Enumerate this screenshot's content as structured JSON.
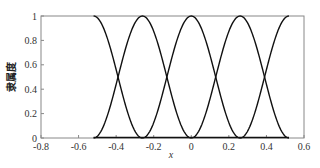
{
  "chart_data": {
    "type": "line",
    "title": "",
    "xlabel": "x",
    "ylabel": "隶属度",
    "xlim": [
      -0.8,
      0.6
    ],
    "ylim": [
      0,
      1
    ],
    "xticks": [
      -0.8,
      -0.6,
      -0.4,
      -0.2,
      0,
      0.2,
      0.4,
      0.6
    ],
    "xtick_labels": [
      "-0.8",
      "-0.6",
      "-0.4",
      "-0.2",
      "0",
      "0.2",
      "0.4",
      "0.6"
    ],
    "yticks": [
      0,
      0.2,
      0.4,
      0.6,
      0.8,
      1
    ],
    "ytick_labels": [
      "0",
      "0.2",
      "0.4",
      "0.6",
      "0.8",
      "1"
    ],
    "grid": false,
    "legend": null,
    "series": [
      {
        "name": "MF1 (left shoulder)",
        "shape": "z-shaped",
        "x_start": -0.52,
        "x_flat_end": -0.52,
        "x_zero": -0.26,
        "peak": 1
      },
      {
        "name": "MF2",
        "shape": "gaussian-like",
        "center": -0.26,
        "support": [
          -0.52,
          0.0
        ],
        "peak": 1
      },
      {
        "name": "MF3",
        "shape": "gaussian-like",
        "center": 0.0,
        "support": [
          -0.26,
          0.26
        ],
        "peak": 1
      },
      {
        "name": "MF4",
        "shape": "gaussian-like",
        "center": 0.26,
        "support": [
          0.0,
          0.52
        ],
        "peak": 1
      },
      {
        "name": "MF5 (right shoulder)",
        "shape": "s-shaped",
        "x_zero": 0.26,
        "x_full": 0.52,
        "peak": 1
      }
    ],
    "crossover_points": [
      {
        "x": -0.39,
        "y": 0.35
      },
      {
        "x": -0.13,
        "y": 0.35
      },
      {
        "x": 0.13,
        "y": 0.35
      },
      {
        "x": 0.39,
        "y": 0.35
      }
    ]
  }
}
